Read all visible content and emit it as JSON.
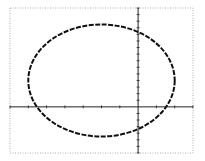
{
  "chart_data": {
    "type": "line",
    "title": "",
    "xlabel": "",
    "ylabel": "",
    "xlim": [
      -7,
      3
    ],
    "ylim": [
      -7,
      15
    ],
    "x_tick_step": 1,
    "y_tick_step": 1,
    "grid": false,
    "legend": "none",
    "series": [
      {
        "name": "ellipse",
        "shape": "ellipse",
        "center": [
          -2,
          4
        ],
        "semi_axis_x": 4,
        "semi_axis_y": 8.5,
        "style": "stepped-dashed"
      }
    ],
    "colors": {
      "curve": "#111111",
      "axes": "#222222",
      "frame": "#9a9a9a"
    }
  }
}
